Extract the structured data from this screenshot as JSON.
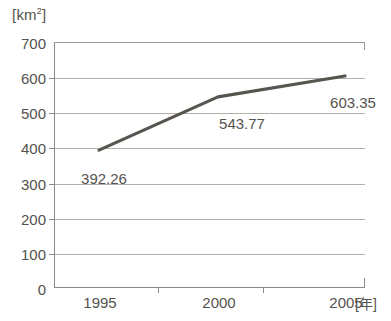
{
  "chart_data": {
    "type": "line",
    "title": "",
    "xlabel": "[年]",
    "ylabel": "[km2]",
    "unit_label_text": "km",
    "unit_label_sup": "2",
    "x_unit_label": "[年]",
    "categories": [
      "1995",
      "2000",
      "2005"
    ],
    "x": [
      1995,
      2000,
      2005
    ],
    "values": [
      392.26,
      543.77,
      603.35
    ],
    "point_labels": [
      "392.26",
      "543.77",
      "603.35"
    ],
    "ylim": [
      0,
      700
    ],
    "ytick_values": [
      0,
      100,
      200,
      300,
      400,
      500,
      600,
      700
    ],
    "ytick_labels": [
      "0",
      "100",
      "200",
      "300",
      "400",
      "500",
      "600",
      "700"
    ],
    "xtick_labels": [
      "1995",
      "2000",
      "2005"
    ],
    "grid": "horizontal",
    "legend": "none",
    "series": [
      {
        "name": "area",
        "values": [
          392.26,
          543.77,
          603.35
        ]
      }
    ],
    "line_color": "#585550",
    "grid_color": "#b3b0a9",
    "axis_color": "#8d8a84",
    "text_color": "#55524d",
    "background_color": "#ffffff"
  }
}
